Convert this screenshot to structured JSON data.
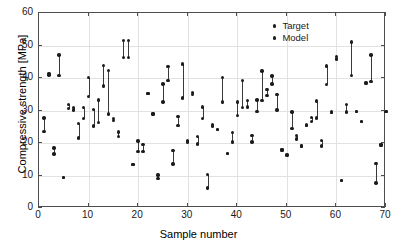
{
  "chart_data": {
    "type": "scatter",
    "title": "",
    "xlabel": "Sample number",
    "ylabel": "Compressive strength [MPa]",
    "xlim": [
      0,
      70
    ],
    "ylim": [
      0,
      60
    ],
    "xticks": [
      0,
      10,
      20,
      30,
      40,
      50,
      60,
      70
    ],
    "yticks": [
      0,
      10,
      20,
      30,
      40,
      50,
      60
    ],
    "grid": true,
    "legend_position": "top-right",
    "legend": [
      "Target",
      "Model"
    ],
    "marker": "filled-circle",
    "marker_color": "#1c1c1c",
    "connector_color": "#3a3a3a",
    "note": "Each sample number has a Target value and a Model value joined by a vertical line segment.",
    "x": [
      1,
      2,
      3,
      4,
      5,
      6,
      7,
      8,
      9,
      10,
      11,
      12,
      13,
      14,
      15,
      16,
      17,
      18,
      19,
      20,
      21,
      22,
      23,
      24,
      25,
      26,
      27,
      28,
      29,
      30,
      31,
      32,
      33,
      34,
      35,
      36,
      37,
      38,
      39,
      40,
      41,
      42,
      43,
      44,
      45,
      46,
      47,
      48,
      49,
      50,
      51,
      52,
      53,
      54,
      55,
      56,
      57,
      58,
      59,
      60,
      61,
      62,
      63,
      64,
      65,
      66,
      67,
      68,
      69,
      70
    ],
    "series": [
      {
        "name": "Target",
        "values": [
          27.7,
          41.4,
          18.5,
          47.1,
          9.4,
          31.9,
          31.0,
          26.0,
          30.9,
          40.1,
          30.4,
          33.2,
          43.8,
          28.9,
          27.5,
          23.4,
          51.5,
          46.3,
          13.3,
          20.6,
          17.3,
          35.3,
          28.9,
          10.2,
          38.2,
          43.6,
          17.7,
          28.2,
          44.3,
          20.8,
          35.6,
          22.0,
          31.1,
          10.3,
          25.6,
          24.1,
          40.1,
          16.8,
          23.3,
          32.6,
          39.2,
          33.0,
          22.3,
          33.2,
          42.1,
          36.5,
          40.6,
          35.0,
          17.9,
          16.5,
          29.5,
          22.3,
          19.1,
          25.6,
          27.9,
          32.9,
          20.8,
          43.7,
          29.4,
          46.6,
          8.4,
          31.9,
          51.1,
          29.7,
          26.6,
          38.6,
          47.1,
          13.7,
          19.4,
          29.7
        ]
      },
      {
        "name": "Model",
        "values": [
          23.6,
          40.9,
          16.6,
          40.8,
          9.4,
          30.6,
          30.2,
          21.6,
          27.6,
          34.4,
          25.2,
          26.4,
          37.6,
          42.4,
          26.9,
          22.0,
          46.3,
          51.5,
          13.3,
          17.4,
          19.6,
          35.3,
          28.9,
          9.0,
          32.6,
          39.3,
          13.6,
          25.3,
          33.9,
          20.3,
          35.0,
          19.7,
          27.6,
          6.1,
          25.0,
          24.1,
          32.6,
          16.8,
          20.3,
          28.4,
          31.0,
          31.1,
          20.3,
          29.7,
          33.0,
          34.7,
          38.1,
          30.2,
          17.9,
          16.2,
          24.5,
          21.2,
          19.1,
          25.4,
          26.6,
          27.7,
          19.1,
          38.0,
          29.6,
          45.8,
          8.4,
          29.6,
          40.8,
          29.7,
          26.6,
          38.4,
          39.0,
          7.7,
          19.4,
          29.7
        ]
      }
    ]
  }
}
